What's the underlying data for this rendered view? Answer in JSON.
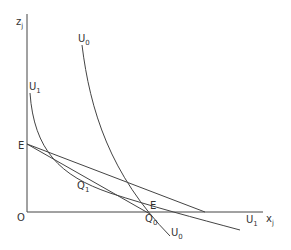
{
  "diagram": {
    "axes": {
      "y_label": "z",
      "y_label_sub": "j",
      "x_label": "x",
      "x_label_sub": "j",
      "origin_label": "O"
    },
    "curves": [
      {
        "name": "U",
        "sub": "0",
        "label_top": "U0",
        "label_bottom": "U0"
      },
      {
        "name": "U",
        "sub": "1",
        "label_top": "U1",
        "label_bottom": "U1"
      }
    ],
    "points": {
      "budget_intercept": "E",
      "tangency_1": "Q",
      "tangency_1_sub": "1",
      "point_0": "Q",
      "point_0_sub": "0",
      "point_e": "E"
    },
    "colors": {
      "line": "#444444",
      "text": "#333333"
    }
  }
}
